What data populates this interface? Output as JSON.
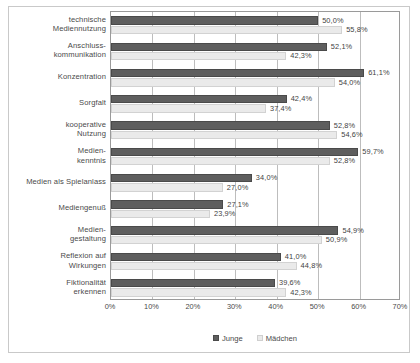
{
  "chart_data": {
    "type": "bar",
    "orientation": "horizontal",
    "title": "",
    "xlabel": "",
    "ylabel": "",
    "xlim": [
      0,
      70
    ],
    "xticks": [
      "0%",
      "10%",
      "20%",
      "30%",
      "40%",
      "50%",
      "60%",
      "70%"
    ],
    "xtick_values": [
      0,
      10,
      20,
      30,
      40,
      50,
      60,
      70
    ],
    "grid": true,
    "legend_position": "bottom",
    "categories": [
      "technische Mediennutzung",
      "Anschluss-kommunikation",
      "Konzentration",
      "Sorgfalt",
      "kooperative Nutzung",
      "Medien-kenntnis",
      "Medien als Spielanlass",
      "Mediengenuß",
      "Medien-gestaltung",
      "Reflexion auf Wirkungen",
      "Fiktionalität erkennen"
    ],
    "category_lines": [
      [
        "technische",
        "Mediennutzung"
      ],
      [
        "Anschluss-",
        "kommunikation"
      ],
      [
        "Konzentration"
      ],
      [
        "Sorgfalt"
      ],
      [
        "kooperative",
        "Nutzung"
      ],
      [
        "Medien-",
        "kenntnis"
      ],
      [
        "Medien als Spielanlass"
      ],
      [
        "Mediengenuß"
      ],
      [
        "Medien-",
        "gestaltung"
      ],
      [
        "Reflexion auf",
        "Wirkungen"
      ],
      [
        "Fiktionalität",
        "erkennen"
      ]
    ],
    "series": [
      {
        "name": "Junge",
        "color": "#5e5e5e",
        "values": [
          50.0,
          52.1,
          61.1,
          42.4,
          52.8,
          59.7,
          34.0,
          27.1,
          54.9,
          41.0,
          39.6
        ],
        "labels": [
          "50,0%",
          "52,1%",
          "61,1%",
          "42,4%",
          "52,8%",
          "59,7%",
          "34,0%",
          "27,1%",
          "54,9%",
          "41,0%",
          "39,6%"
        ]
      },
      {
        "name": "Mädchen",
        "color": "#eaeaea",
        "values": [
          55.8,
          42.3,
          54.0,
          37.4,
          54.6,
          52.8,
          27.0,
          23.9,
          50.9,
          44.8,
          42.3
        ],
        "labels": [
          "55,8%",
          "42,3%",
          "54,0%",
          "37,4%",
          "54,6%",
          "52,8%",
          "27,0%",
          "23,9%",
          "50,9%",
          "44,8%",
          "42,3%"
        ]
      }
    ]
  },
  "legend": {
    "items": [
      {
        "label": "Junge",
        "swatch": "junge"
      },
      {
        "label": "Mädchen",
        "swatch": "maedchen"
      }
    ]
  }
}
